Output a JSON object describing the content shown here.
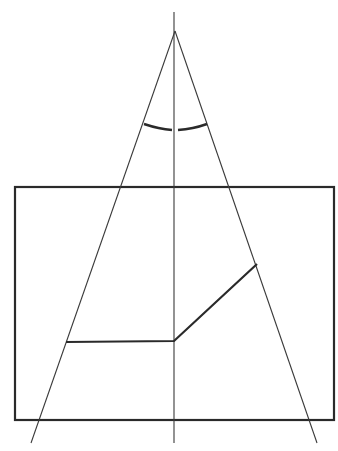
{
  "diagram": {
    "width": 338,
    "height": 451,
    "background": "#ffffff",
    "stroke_color": "#2a2a2a",
    "apex": {
      "x": 175,
      "y": 31
    },
    "vertical_axis": {
      "x1": 174,
      "y1": 12,
      "x2": 174,
      "y2": 443
    },
    "left_ray": {
      "x1": 175,
      "y1": 31,
      "x2": 31,
      "y2": 443
    },
    "right_ray": {
      "x1": 175,
      "y1": 31,
      "x2": 317,
      "y2": 443
    },
    "rectangle": {
      "x": 15,
      "y": 187,
      "width": 319,
      "height": 233
    },
    "angle_arc": {
      "left": "M 144 124 Q 159 129 172 130",
      "right": "M 178 130 Q 193 129 207 124"
    },
    "broken_line": {
      "points": "66,342 174,341 257,264"
    }
  }
}
